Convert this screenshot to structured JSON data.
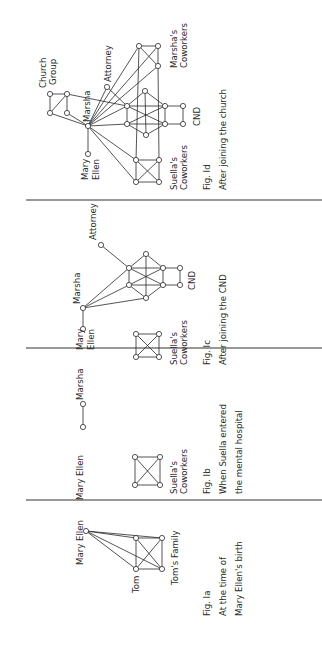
{
  "figure": {
    "orientation": "rotated-90-ccw",
    "panels": [
      {
        "id": "1a",
        "fig_label": "Fig. Ia",
        "caption_line1": "At the time of",
        "caption_line2": "Mary Ellen's birth",
        "labels": {
          "mary_ellen": "Mary Ellen",
          "tom": "Tom",
          "toms_family": "Tom's Family"
        },
        "nodes": [
          {
            "id": "mary_ellen",
            "x": 86,
            "y": 531
          },
          {
            "id": "f1",
            "x": 136,
            "y": 538
          },
          {
            "id": "f2",
            "x": 162,
            "y": 538
          },
          {
            "id": "tom",
            "x": 136,
            "y": 569
          },
          {
            "id": "f4",
            "x": 162,
            "y": 569
          }
        ],
        "edges": [
          [
            "mary_ellen",
            "f1"
          ],
          [
            "mary_ellen",
            "f2"
          ],
          [
            "mary_ellen",
            "tom"
          ],
          [
            "mary_ellen",
            "f4"
          ],
          [
            "f1",
            "f2"
          ],
          [
            "f1",
            "tom"
          ],
          [
            "f1",
            "f4"
          ],
          [
            "f2",
            "tom"
          ],
          [
            "f2",
            "f4"
          ],
          [
            "tom",
            "f4"
          ]
        ]
      },
      {
        "id": "1b",
        "fig_label": "Fig. Ib",
        "caption_line1": "When Suella entered",
        "caption_line2": "the mental hospital",
        "labels": {
          "mary_ellen": "Mary Ellen",
          "marsha": "Marsha",
          "suellas_coworkers_line1": "Suella's",
          "suellas_coworkers_line2": "Coworkers"
        },
        "nodes": [
          {
            "id": "mary_ellen",
            "x": 83,
            "y": 427
          },
          {
            "id": "marsha",
            "x": 83,
            "y": 404
          },
          {
            "id": "s1",
            "x": 135,
            "y": 457
          },
          {
            "id": "s2",
            "x": 160,
            "y": 457
          },
          {
            "id": "s3",
            "x": 135,
            "y": 485
          },
          {
            "id": "s4",
            "x": 160,
            "y": 485
          }
        ],
        "edges": [
          [
            "mary_ellen",
            "marsha"
          ],
          [
            "s1",
            "s2"
          ],
          [
            "s1",
            "s3"
          ],
          [
            "s1",
            "s4"
          ],
          [
            "s2",
            "s3"
          ],
          [
            "s2",
            "s4"
          ],
          [
            "s3",
            "s4"
          ]
        ]
      },
      {
        "id": "1c",
        "fig_label": "Fig. Ic",
        "caption_line1": "After joining the CND",
        "caption_line2": "",
        "labels": {
          "mary_ellen_line1": "Mary",
          "mary_ellen_line2": "Ellen",
          "marsha": "Marsha",
          "attorney": "Attorney",
          "cnd": "CND",
          "suellas_coworkers_line1": "Suella's",
          "suellas_coworkers_line2": "Coworkers"
        },
        "nodes": [
          {
            "id": "mary_ellen",
            "x": 83,
            "y": 329
          },
          {
            "id": "marsha",
            "x": 83,
            "y": 308
          },
          {
            "id": "attorney",
            "x": 101,
            "y": 245
          },
          {
            "id": "h_top",
            "x": 146,
            "y": 254
          },
          {
            "id": "h_ul",
            "x": 129,
            "y": 268
          },
          {
            "id": "h_ur",
            "x": 163,
            "y": 268
          },
          {
            "id": "h_ll",
            "x": 129,
            "y": 285
          },
          {
            "id": "h_lr",
            "x": 163,
            "y": 285
          },
          {
            "id": "h_bot",
            "x": 146,
            "y": 298
          },
          {
            "id": "c1",
            "x": 180,
            "y": 268
          },
          {
            "id": "c2",
            "x": 180,
            "y": 285
          },
          {
            "id": "s1",
            "x": 136,
            "y": 334
          },
          {
            "id": "s2",
            "x": 159,
            "y": 334
          },
          {
            "id": "s3",
            "x": 136,
            "y": 357
          },
          {
            "id": "s4",
            "x": 159,
            "y": 357
          }
        ],
        "edges": [
          [
            "mary_ellen",
            "marsha"
          ],
          [
            "marsha",
            "h_ul"
          ],
          [
            "marsha",
            "h_ll"
          ],
          [
            "marsha",
            "h_bot"
          ],
          [
            "attorney",
            "h_ul"
          ],
          [
            "h_top",
            "h_ul"
          ],
          [
            "h_top",
            "h_ur"
          ],
          [
            "h_top",
            "h_bot"
          ],
          [
            "h_ul",
            "h_ur"
          ],
          [
            "h_ul",
            "h_ll"
          ],
          [
            "h_ul",
            "h_lr"
          ],
          [
            "h_ur",
            "h_lr"
          ],
          [
            "h_ur",
            "h_ll"
          ],
          [
            "h_ll",
            "h_lr"
          ],
          [
            "h_ll",
            "h_bot"
          ],
          [
            "h_lr",
            "h_bot"
          ],
          [
            "h_ur",
            "c1"
          ],
          [
            "h_lr",
            "c2"
          ],
          [
            "c1",
            "c2"
          ],
          [
            "s1",
            "s2"
          ],
          [
            "s1",
            "s3"
          ],
          [
            "s1",
            "s4"
          ],
          [
            "s2",
            "s3"
          ],
          [
            "s2",
            "s4"
          ],
          [
            "s3",
            "s4"
          ]
        ]
      },
      {
        "id": "1d",
        "fig_label": "Fig. Id",
        "caption_line1": "After joining the church",
        "caption_line2": "",
        "labels": {
          "church_group_line1": "Church",
          "church_group_line2": "Group",
          "attorney": "Attorney",
          "marsha": "Marsha",
          "mary_ellen_line1": "Mary",
          "mary_ellen_line2": "Ellen",
          "marshas_coworkers_line1": "Marsha's",
          "marshas_coworkers_line2": "Coworkers",
          "cnd": "CND",
          "suellas_coworkers_line1": "Suella's",
          "suellas_coworkers_line2": "Coworkers"
        },
        "nodes": [
          {
            "id": "mc1",
            "x": 139,
            "y": 46
          },
          {
            "id": "mc2",
            "x": 158,
            "y": 46
          },
          {
            "id": "mc3",
            "x": 158,
            "y": 66
          },
          {
            "id": "attorney",
            "x": 107,
            "y": 87
          },
          {
            "id": "cg1",
            "x": 50,
            "y": 94
          },
          {
            "id": "cg2",
            "x": 67,
            "y": 94
          },
          {
            "id": "cg3",
            "x": 50,
            "y": 113
          },
          {
            "id": "cg4",
            "x": 67,
            "y": 113
          },
          {
            "id": "marsha",
            "x": 88,
            "y": 126
          },
          {
            "id": "mary_ellen",
            "x": 88,
            "y": 154
          },
          {
            "id": "h_top",
            "x": 145,
            "y": 91
          },
          {
            "id": "h_ul",
            "x": 127,
            "y": 106
          },
          {
            "id": "h_ur",
            "x": 165,
            "y": 106
          },
          {
            "id": "h_ll",
            "x": 127,
            "y": 124
          },
          {
            "id": "h_lr",
            "x": 165,
            "y": 124
          },
          {
            "id": "h_bot",
            "x": 146,
            "y": 135
          },
          {
            "id": "c1",
            "x": 183,
            "y": 106
          },
          {
            "id": "c2",
            "x": 183,
            "y": 124
          },
          {
            "id": "s1",
            "x": 136,
            "y": 160
          },
          {
            "id": "s2",
            "x": 159,
            "y": 160
          },
          {
            "id": "s3",
            "x": 136,
            "y": 182
          },
          {
            "id": "s4",
            "x": 159,
            "y": 182
          }
        ],
        "edges": [
          [
            "mary_ellen",
            "marsha"
          ],
          [
            "cg1",
            "cg2"
          ],
          [
            "cg1",
            "cg3"
          ],
          [
            "cg2",
            "cg3"
          ],
          [
            "cg2",
            "cg4"
          ],
          [
            "cg3",
            "marsha"
          ],
          [
            "cg4",
            "marsha"
          ],
          [
            "cg2",
            "h_ul"
          ],
          [
            "marsha",
            "attorney"
          ],
          [
            "attorney",
            "h_ul"
          ],
          [
            "marsha",
            "mc1"
          ],
          [
            "marsha",
            "mc2"
          ],
          [
            "marsha",
            "mc3"
          ],
          [
            "marsha",
            "h_ul"
          ],
          [
            "marsha",
            "h_ll"
          ],
          [
            "marsha",
            "s1"
          ],
          [
            "marsha",
            "s3"
          ],
          [
            "mc1",
            "mc2"
          ],
          [
            "mc1",
            "mc3"
          ],
          [
            "mc2",
            "mc3"
          ],
          [
            "mc1",
            "s1"
          ],
          [
            "mc3",
            "s2"
          ],
          [
            "h_top",
            "h_ul"
          ],
          [
            "h_top",
            "h_ur"
          ],
          [
            "h_top",
            "h_bot"
          ],
          [
            "h_ul",
            "h_ur"
          ],
          [
            "h_ul",
            "h_ll"
          ],
          [
            "h_ul",
            "h_lr"
          ],
          [
            "h_ur",
            "h_lr"
          ],
          [
            "h_ur",
            "h_ll"
          ],
          [
            "h_ll",
            "h_lr"
          ],
          [
            "h_ll",
            "h_bot"
          ],
          [
            "h_lr",
            "h_bot"
          ],
          [
            "h_ur",
            "c1"
          ],
          [
            "h_lr",
            "c2"
          ],
          [
            "c1",
            "c2"
          ],
          [
            "s1",
            "s2"
          ],
          [
            "s1",
            "s3"
          ],
          [
            "s1",
            "s4"
          ],
          [
            "s2",
            "s3"
          ],
          [
            "s2",
            "s4"
          ],
          [
            "s3",
            "s4"
          ]
        ]
      }
    ],
    "dividers_y": [
      200,
      348,
      500
    ]
  }
}
